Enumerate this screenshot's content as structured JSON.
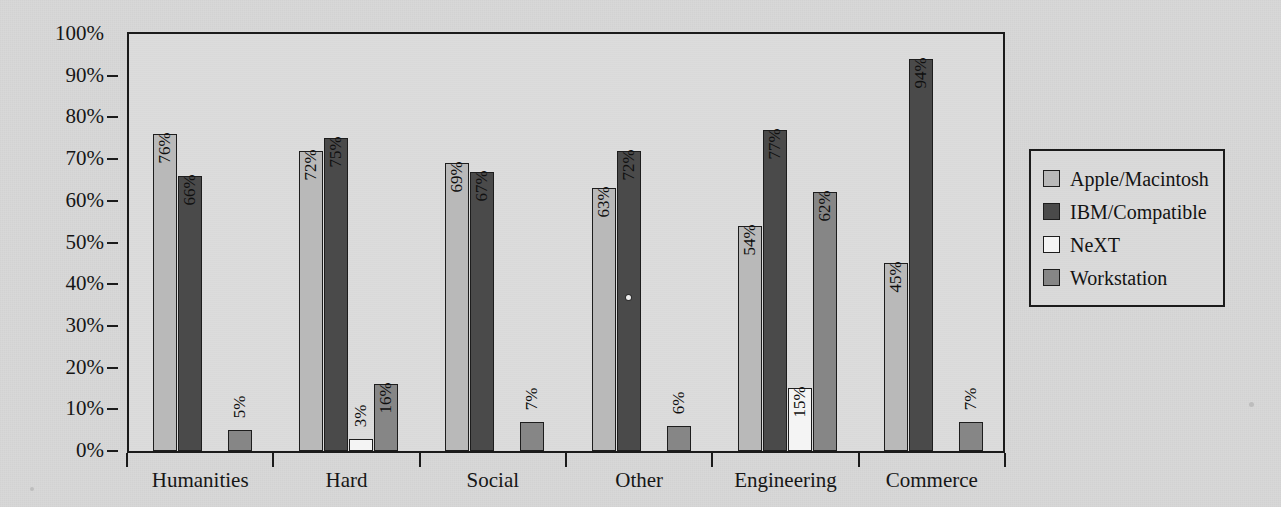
{
  "chart_data": {
    "type": "bar",
    "title": "",
    "subtitle": "",
    "xlabel": "",
    "ylabel": "",
    "ylim": [
      0,
      100
    ],
    "grid": false,
    "legend_position": "right",
    "value_label_suffix": "%",
    "categories": [
      "Humanities",
      "Hard",
      "Social",
      "Other",
      "Engineering",
      "Commerce"
    ],
    "ytick_labels": [
      "0%",
      "10%",
      "20%",
      "30%",
      "40%",
      "50%",
      "60%",
      "70%",
      "80%",
      "90%",
      "100%"
    ],
    "ytick_values": [
      0,
      10,
      20,
      30,
      40,
      50,
      60,
      70,
      80,
      90,
      100
    ],
    "series": [
      {
        "name": "Apple/Macintosh",
        "color": "#b9b9b9",
        "values": [
          76,
          72,
          69,
          63,
          54,
          45
        ],
        "labels": [
          "76%",
          "72%",
          "69%",
          "63%",
          "54%",
          "45%"
        ]
      },
      {
        "name": "IBM/Compatible",
        "color": "#4a4a4a",
        "values": [
          66,
          75,
          67,
          72,
          77,
          94
        ],
        "labels": [
          "66%",
          "75%",
          "67%",
          "72%",
          "77%",
          "94%"
        ]
      },
      {
        "name": "NeXT",
        "color": "#f4f4f4",
        "values": [
          0,
          3,
          0,
          0,
          15,
          0
        ],
        "labels": [
          "",
          "3%",
          "",
          "",
          "15%",
          ""
        ]
      },
      {
        "name": "Workstation",
        "color": "#868686",
        "values": [
          5,
          16,
          7,
          6,
          62,
          7
        ],
        "labels": [
          "5%",
          "16%",
          "7%",
          "6%",
          "62%",
          "7%"
        ]
      }
    ]
  },
  "legend": {
    "items": [
      {
        "label": "Apple/Macintosh",
        "color": "#b9b9b9"
      },
      {
        "label": "IBM/Compatible",
        "color": "#4a4a4a"
      },
      {
        "label": "NeXT",
        "color": "#f4f4f4"
      },
      {
        "label": "Workstation",
        "color": "#868686"
      }
    ]
  }
}
